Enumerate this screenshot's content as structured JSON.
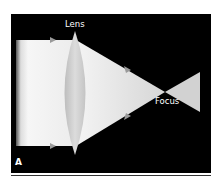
{
  "figure": {
    "panel_label": "A",
    "labels": {
      "lens": "Lens",
      "focus": "Focus"
    },
    "colors": {
      "background": "#000000",
      "beam": "#f2f2f2",
      "lens": "#c8c8c8"
    }
  }
}
